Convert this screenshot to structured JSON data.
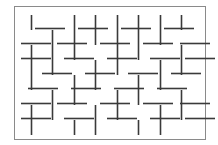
{
  "figure": {
    "name": "herringbone-line-segment-pattern",
    "canvas": {
      "width": 218,
      "height": 145
    },
    "background_color": "#ffffff"
  },
  "border": {
    "x": 14,
    "y": 6,
    "width": 191,
    "height": 133,
    "stroke_color": "#8a8a8a",
    "stroke_width": 1,
    "fill": "none"
  },
  "segments": {
    "stroke_color": "#3a3a3a",
    "stroke_width": 1.6,
    "horizontal_length": 30,
    "vertical_length": 15,
    "horizontal": [
      {
        "x": 35,
        "y": 28
      },
      {
        "x": 78,
        "y": 28
      },
      {
        "x": 121,
        "y": 28
      },
      {
        "x": 164,
        "y": 28
      },
      {
        "x": 21,
        "y": 43
      },
      {
        "x": 57,
        "y": 43
      },
      {
        "x": 100,
        "y": 43
      },
      {
        "x": 143,
        "y": 43
      },
      {
        "x": 180,
        "y": 43
      },
      {
        "x": 21,
        "y": 58
      },
      {
        "x": 64,
        "y": 58
      },
      {
        "x": 107,
        "y": 58
      },
      {
        "x": 150,
        "y": 58
      },
      {
        "x": 185,
        "y": 58
      },
      {
        "x": 42,
        "y": 73
      },
      {
        "x": 85,
        "y": 73
      },
      {
        "x": 128,
        "y": 73
      },
      {
        "x": 171,
        "y": 73
      },
      {
        "x": 28,
        "y": 88
      },
      {
        "x": 71,
        "y": 88
      },
      {
        "x": 114,
        "y": 88
      },
      {
        "x": 157,
        "y": 88
      },
      {
        "x": 21,
        "y": 103
      },
      {
        "x": 57,
        "y": 103
      },
      {
        "x": 100,
        "y": 103
      },
      {
        "x": 143,
        "y": 103
      },
      {
        "x": 180,
        "y": 103
      },
      {
        "x": 21,
        "y": 118
      },
      {
        "x": 64,
        "y": 118
      },
      {
        "x": 107,
        "y": 118
      },
      {
        "x": 150,
        "y": 118
      },
      {
        "x": 185,
        "y": 118
      }
    ],
    "vertical": [
      {
        "x": 31,
        "y": 15
      },
      {
        "x": 74,
        "y": 15
      },
      {
        "x": 95,
        "y": 15
      },
      {
        "x": 117,
        "y": 15
      },
      {
        "x": 138,
        "y": 15
      },
      {
        "x": 160,
        "y": 15
      },
      {
        "x": 181,
        "y": 15
      },
      {
        "x": 52,
        "y": 30
      },
      {
        "x": 74,
        "y": 30
      },
      {
        "x": 95,
        "y": 30
      },
      {
        "x": 117,
        "y": 30
      },
      {
        "x": 138,
        "y": 30
      },
      {
        "x": 160,
        "y": 30
      },
      {
        "x": 31,
        "y": 45
      },
      {
        "x": 52,
        "y": 45
      },
      {
        "x": 74,
        "y": 45
      },
      {
        "x": 117,
        "y": 45
      },
      {
        "x": 138,
        "y": 45
      },
      {
        "x": 181,
        "y": 45
      },
      {
        "x": 31,
        "y": 60
      },
      {
        "x": 52,
        "y": 60
      },
      {
        "x": 95,
        "y": 60
      },
      {
        "x": 117,
        "y": 60
      },
      {
        "x": 160,
        "y": 60
      },
      {
        "x": 181,
        "y": 60
      },
      {
        "x": 31,
        "y": 75
      },
      {
        "x": 74,
        "y": 75
      },
      {
        "x": 95,
        "y": 75
      },
      {
        "x": 138,
        "y": 75
      },
      {
        "x": 160,
        "y": 75
      },
      {
        "x": 52,
        "y": 90
      },
      {
        "x": 74,
        "y": 90
      },
      {
        "x": 117,
        "y": 90
      },
      {
        "x": 138,
        "y": 90
      },
      {
        "x": 181,
        "y": 90
      },
      {
        "x": 31,
        "y": 105
      },
      {
        "x": 52,
        "y": 105
      },
      {
        "x": 95,
        "y": 105
      },
      {
        "x": 117,
        "y": 105
      },
      {
        "x": 160,
        "y": 105
      },
      {
        "x": 181,
        "y": 105
      },
      {
        "x": 31,
        "y": 120
      },
      {
        "x": 74,
        "y": 120
      },
      {
        "x": 95,
        "y": 120
      },
      {
        "x": 138,
        "y": 120
      },
      {
        "x": 160,
        "y": 120
      }
    ]
  }
}
